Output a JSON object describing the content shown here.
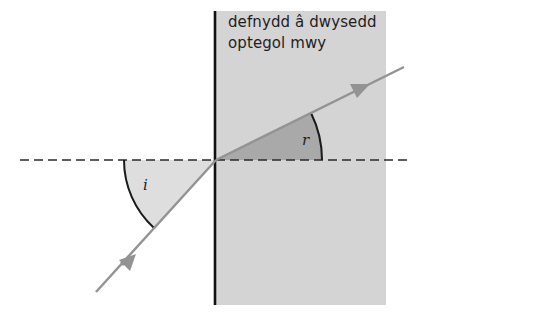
{
  "diagram": {
    "type": "refraction",
    "medium_label": {
      "line1": "defnydd â dwysedd",
      "line2": "optegol mwy"
    },
    "angles": {
      "incidence_label": "i",
      "refraction_label": "r"
    },
    "colors": {
      "medium_fill": "#d4d4d4",
      "refraction_wedge": "#a9a9a9",
      "incidence_wedge": "#dedede",
      "ray": "#939393",
      "boundary": "#111111",
      "normal": "#2a2a2a",
      "arc": "#1a1a1a"
    }
  }
}
